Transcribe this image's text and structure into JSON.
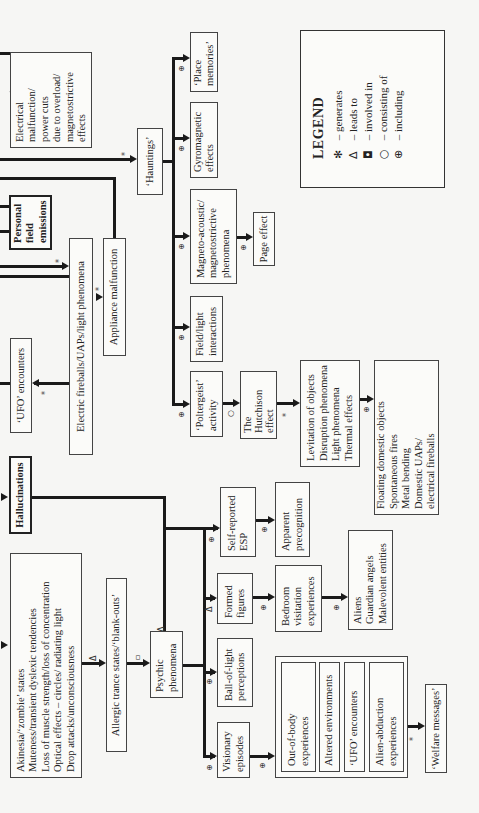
{
  "diagram": {
    "orientation": "rotated-90-ccw",
    "nodes": {
      "electrical_malfunction": [
        "Electrical",
        "malfunction/",
        "power cuts",
        "due to overload/",
        "magnetostrictive",
        "effects"
      ],
      "hauntings": "‘Hauntings’",
      "personal_field_emissions": [
        "Personal",
        "field",
        "emissions"
      ],
      "electric_fireballs": "Electric fireballs/UAPs/light phenomena",
      "appliance_malfunction": "Appliance malfunction",
      "ufo_encounters_top": "‘UFO’ encounters",
      "hallucinations": "Hallucinations",
      "akinesia_box": [
        "Akinesia/‘zombie’ states",
        "Muteness/transient dyslexic tendencies",
        "Loss of muscle strength/loss of concentration",
        "Optical effects – circles/ radiating light",
        "Drop attacks/unconsciousness"
      ],
      "allergic_trance": "Allergic trance states/‘blank-outs’",
      "psychic_phenomena": [
        "Psychic",
        "phenomena"
      ],
      "place_memories": [
        "‘Place",
        "memories’"
      ],
      "gyromagnetic": [
        "Gyromagnetic",
        "effects"
      ],
      "magneto_acoustic": [
        "Magneto-acoustic/",
        "magnetostrictive",
        "phenomena"
      ],
      "page_effect": "Page effect",
      "field_light": [
        "Field/light",
        "interactions"
      ],
      "poltergeist": [
        "‘Poltergeist’",
        "activity"
      ],
      "hutchison": [
        "The",
        "Hutchison",
        "effect"
      ],
      "levitation_box": [
        "Levitation of objects",
        "Disruption phenomena",
        "Light phenomena",
        "Thermal effects"
      ],
      "floating_box": [
        "Floating domestic objects",
        "Spontaneous fires",
        "Metal bending",
        "Domestic UAPs/",
        "electrical fireballs"
      ],
      "visionary": [
        "Visionary",
        "episodes"
      ],
      "ball_of_light": [
        "Ball-of-light",
        "perceptions"
      ],
      "formed_figures": [
        "Formed",
        "figures"
      ],
      "self_reported_esp": [
        "Self-reported",
        "ESP"
      ],
      "apparent_precognition": [
        "Apparent",
        "precognition"
      ],
      "bedroom_visitation": [
        "Bedroom",
        "visitation",
        "experiences"
      ],
      "entities_box": [
        "Aliens",
        "Guardian angels",
        "Malevolent entities"
      ],
      "out_of_body": [
        "Out-of-body",
        "experiences"
      ],
      "altered_environments": "Altered environments",
      "ufo_encounters_inner": "‘UFO’ encounters",
      "alien_abduction": [
        "Alien-abduction",
        "experiences"
      ],
      "welfare_messages": "‘Welfare messages’"
    },
    "symbols": {
      "generates": "*",
      "leads_to": "Δ",
      "involved_in": "▫",
      "consisting_of": "○",
      "including": "⊕"
    }
  },
  "legend": {
    "title": "LEGEND",
    "items": [
      {
        "glyph": "✻",
        "label": "– generates"
      },
      {
        "glyph": "Δ",
        "label": "– leads to"
      },
      {
        "glyph": "◘",
        "label": "– involved in"
      },
      {
        "glyph": "○",
        "label": "– consisting of"
      },
      {
        "glyph": "⊕",
        "label": "– including"
      }
    ]
  }
}
